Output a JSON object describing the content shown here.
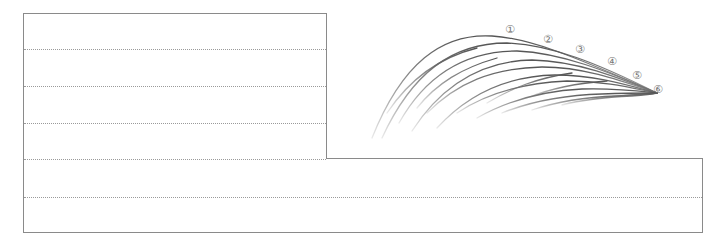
{
  "sheet": {
    "type": "handwriting-practice-sheet",
    "line_color": "#9a9a9a",
    "frame_color": "#8a8a8a"
  },
  "illustration": {
    "description": "curved brush strokes converging to a point",
    "stroke_color": "#6e6e6e",
    "labels": [
      "①",
      "②",
      "③",
      "④",
      "⑤",
      "⑥"
    ]
  }
}
